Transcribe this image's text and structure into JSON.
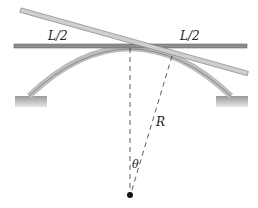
{
  "diagram": {
    "labels": {
      "left_half": "L/2",
      "right_half": "L/2",
      "radius": "R",
      "angle": "θ"
    },
    "colors": {
      "horizontal_bar": "#8c8c8c",
      "tilted_bar": "#c4c4c4",
      "arc": "#bdbdbd",
      "support": "#a8a8a8",
      "dashed_line": "#333333",
      "center_dot": "#111111"
    }
  }
}
